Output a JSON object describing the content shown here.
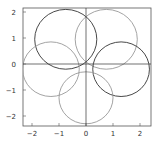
{
  "chart_data": {
    "type": "line",
    "title": "",
    "xlabel": "",
    "ylabel": "",
    "xlim": [
      -2.4,
      2.4
    ],
    "ylim": [
      -2.4,
      2.2
    ],
    "grid": false,
    "axes_through_origin": true,
    "x_ticks": [
      -2,
      -1,
      0,
      1,
      2
    ],
    "y_ticks": [
      2,
      1,
      0,
      -1,
      -2
    ],
    "x_tick_labels": [
      "−2",
      "−1",
      "0",
      "1",
      "2"
    ],
    "y_tick_labels": [
      "2",
      "1",
      "0",
      "−1",
      "−2"
    ],
    "series": [
      {
        "name": "loop-top-left",
        "shape": "circle",
        "center": [
          -0.75,
          0.95
        ],
        "radius": 1.15,
        "color": "#333333"
      },
      {
        "name": "loop-top-right",
        "shape": "circle",
        "center": [
          0.75,
          0.95
        ],
        "radius": 1.15,
        "color": "#999999"
      },
      {
        "name": "loop-right",
        "shape": "circle",
        "center": [
          1.3,
          -0.2
        ],
        "radius": 1.05,
        "color": "#333333"
      },
      {
        "name": "loop-left",
        "shape": "circle",
        "center": [
          -1.3,
          -0.2
        ],
        "radius": 1.05,
        "color": "#999999"
      },
      {
        "name": "loop-bottom",
        "shape": "circle",
        "center": [
          0,
          -1.3
        ],
        "radius": 1.0,
        "color": "#999999"
      }
    ]
  }
}
